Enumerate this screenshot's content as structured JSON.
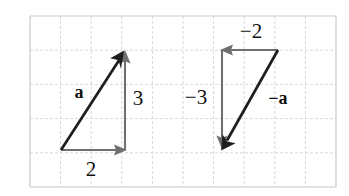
{
  "figure": {
    "background_color": "#ffffff",
    "width": 349,
    "height": 196
  },
  "grid": {
    "columns": 10,
    "rows": 5,
    "left": 30,
    "top": 16,
    "right": 336,
    "bottom": 187,
    "cell_width": 30.6,
    "cell_height": 34.2,
    "line_color": "#d8d8dc",
    "border_color": "#c9c9cf",
    "style": "dashed"
  },
  "colors": {
    "vector_stroke": "#1e1e1e",
    "component_stroke": "#6f6f6f",
    "label_text": "#111111"
  },
  "diagrams": [
    {
      "id": "vector-a",
      "name": "vector-a-diagram",
      "vector_label": "a",
      "horizontal_label": "2",
      "vertical_label": "3",
      "components": {
        "x": 2,
        "y": 3
      },
      "tail": {
        "x": 61,
        "y": 150
      },
      "tip": {
        "x": 125,
        "y": 51
      },
      "horizontal_arrow": {
        "x1": 61,
        "y1": 150,
        "x2": 125,
        "y2": 150
      },
      "vertical_arrow": {
        "x1": 125,
        "y1": 150,
        "x2": 125,
        "y2": 51
      },
      "label_positions": {
        "vector": {
          "x": 79,
          "y": 92
        },
        "horizontal": {
          "x": 91,
          "y": 169
        },
        "vertical": {
          "x": 138,
          "y": 98
        }
      }
    },
    {
      "id": "vector-neg-a",
      "name": "vector-negative-a-diagram",
      "vector_label": "−a",
      "horizontal_label": "−2",
      "vertical_label": "−3",
      "components": {
        "x": -2,
        "y": -3
      },
      "tail": {
        "x": 278,
        "y": 50
      },
      "tip": {
        "x": 222,
        "y": 150
      },
      "horizontal_arrow": {
        "x1": 278,
        "y1": 50,
        "x2": 222,
        "y2": 50
      },
      "vertical_arrow": {
        "x1": 222,
        "y1": 50,
        "x2": 222,
        "y2": 148
      },
      "label_positions": {
        "vector": {
          "x": 278,
          "y": 98
        },
        "horizontal": {
          "x": 251,
          "y": 31
        },
        "vertical": {
          "x": 196,
          "y": 97
        }
      }
    }
  ]
}
